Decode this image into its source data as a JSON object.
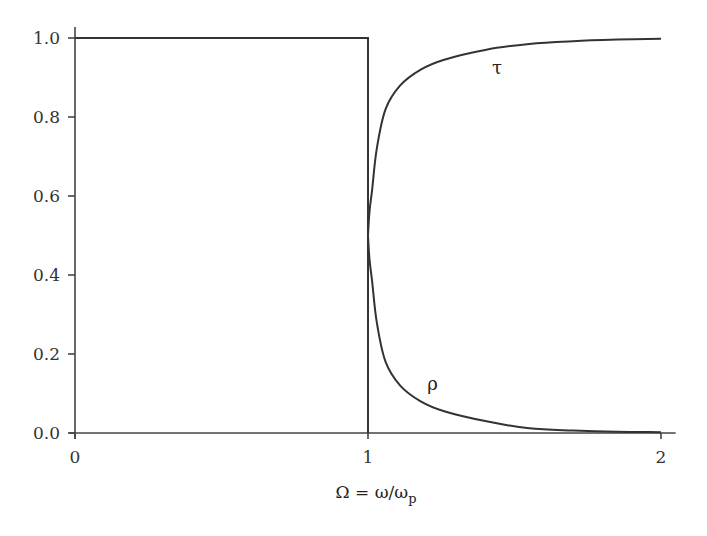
{
  "chart_data": {
    "type": "line",
    "title": "",
    "xlabel": "Ω = ω/ω",
    "xlabel_subscript": "p",
    "ylabel": "",
    "xlim": [
      0,
      2.05
    ],
    "ylim": [
      0,
      1.0
    ],
    "grid": false,
    "legend": "none",
    "x_ticks": [
      0,
      1,
      2
    ],
    "x_tick_labels": [
      "0",
      "1",
      "2"
    ],
    "y_ticks": [
      0.0,
      0.2,
      0.4,
      0.6,
      0.8,
      1.0
    ],
    "y_tick_labels": [
      "0.0",
      "0.2",
      "0.4",
      "0.6",
      "0.8",
      "1.0"
    ],
    "series": [
      {
        "name": "ρ (Ω < 1)",
        "label": "",
        "x": [
          0,
          1,
          1
        ],
        "y": [
          1.0,
          1.0,
          0.0
        ]
      },
      {
        "name": "τ",
        "label": "τ",
        "x": [
          1.0,
          1.005,
          1.014,
          1.03,
          1.06,
          1.11,
          1.18,
          1.26,
          1.4,
          1.55,
          1.7,
          1.85,
          2.0
        ],
        "y": [
          0.5,
          0.56,
          0.615,
          0.72,
          0.82,
          0.88,
          0.92,
          0.945,
          0.97,
          0.985,
          0.992,
          0.996,
          0.998
        ]
      },
      {
        "name": "ρ",
        "label": "ρ",
        "x": [
          1.0,
          1.005,
          1.014,
          1.03,
          1.06,
          1.11,
          1.18,
          1.26,
          1.4,
          1.55,
          1.7,
          1.85,
          2.0
        ],
        "y": [
          0.5,
          0.44,
          0.385,
          0.28,
          0.18,
          0.12,
          0.08,
          0.055,
          0.03,
          0.012,
          0.006,
          0.003,
          0.002
        ]
      }
    ],
    "annotations": [
      {
        "text": "τ",
        "x": 1.44,
        "y": 0.91
      },
      {
        "text": "ρ",
        "x": 1.22,
        "y": 0.11
      }
    ]
  }
}
